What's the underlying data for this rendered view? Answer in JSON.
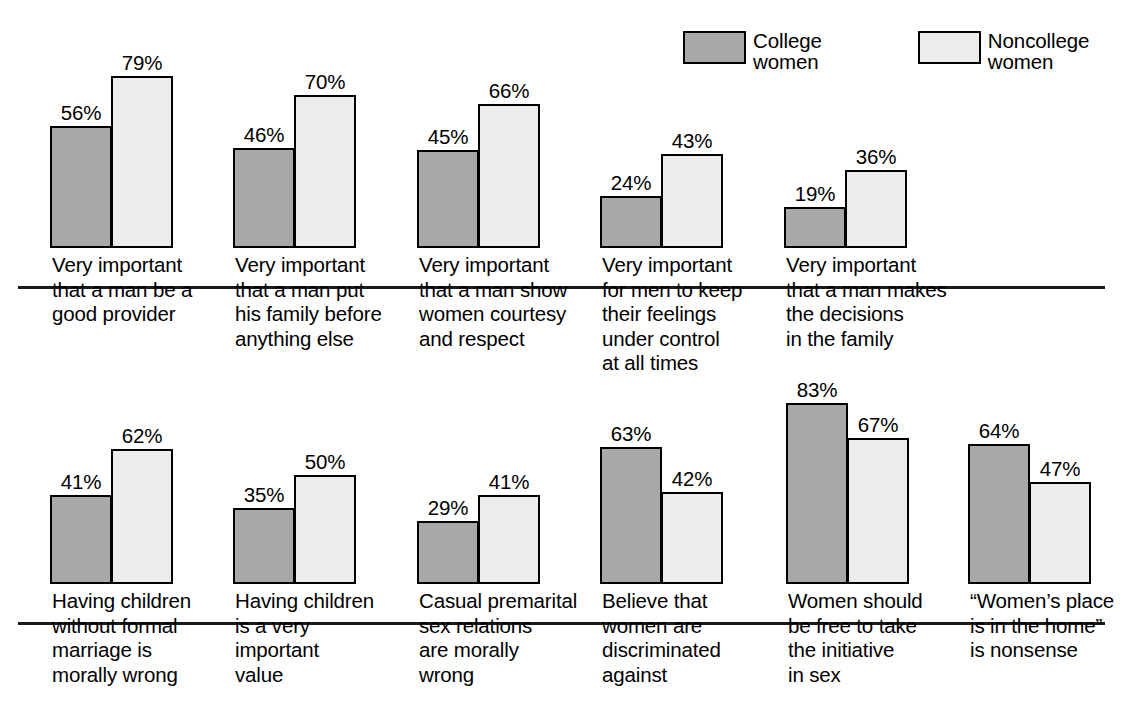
{
  "legend": {
    "entries": [
      {
        "label": "College\nwomen",
        "color": "#a8a8a8",
        "series": "college"
      },
      {
        "label": "Noncollege\nwomen",
        "color": "#ececec",
        "series": "noncollege"
      }
    ]
  },
  "chart_data": {
    "type": "bar",
    "title": "",
    "subtitle": "",
    "xlabel": "",
    "ylabel": "",
    "ylim": [
      0,
      100
    ],
    "grid": false,
    "legend_position": "top-right",
    "value_suffix": "%",
    "series": [
      {
        "name": "College women",
        "color": "#a8a8a8",
        "values": [
          56,
          46,
          45,
          24,
          19,
          41,
          35,
          29,
          63,
          83,
          64
        ]
      },
      {
        "name": "Noncollege women",
        "color": "#ececec",
        "values": [
          79,
          70,
          66,
          43,
          36,
          62,
          50,
          41,
          42,
          67,
          47
        ]
      }
    ],
    "categories": [
      "Very important\nthat a man be a\ngood provider",
      "Very important\nthat a man put\nhis family before\nanything else",
      "Very important\nthat a man show\nwomen courtesy\nand respect",
      "Very important\nfor men to keep\ntheir feelings\nunder control\nat all times",
      "Very important\nthat a man makes\nthe decisions\nin the family",
      "Having children\nwithout formal\nmarriage is\nmorally wrong",
      "Having children\nis a very\nimportant\nvalue",
      "Casual premarital\nsex relations\nare morally\nwrong",
      "Believe that\nwomen are\ndiscriminated\nagainst",
      "Women should\nbe free to take\nthe initiative\nin sex",
      "“Women’s place\nis in the home”\nis nonsense"
    ],
    "panels": [
      {
        "name": "row-1",
        "groups": [
          {
            "category": "Very important\nthat a man be a\ngood provider",
            "college": 56,
            "noncollege": 79,
            "college_label": "56%",
            "noncollege_label": "79%"
          },
          {
            "category": "Very important\nthat a man put\nhis family before\nanything else",
            "college": 46,
            "noncollege": 70,
            "college_label": "46%",
            "noncollege_label": "70%"
          },
          {
            "category": "Very important\nthat a man show\nwomen courtesy\nand respect",
            "college": 45,
            "noncollege": 66,
            "college_label": "45%",
            "noncollege_label": "66%"
          },
          {
            "category": "Very important\nfor men to keep\ntheir feelings\nunder control\nat all times",
            "college": 24,
            "noncollege": 43,
            "college_label": "24%",
            "noncollege_label": "43%"
          },
          {
            "category": "Very important\nthat a man makes\nthe decisions\nin the family",
            "college": 19,
            "noncollege": 36,
            "college_label": "19%",
            "noncollege_label": "36%"
          }
        ]
      },
      {
        "name": "row-2",
        "groups": [
          {
            "category": "Having children\nwithout formal\nmarriage is\nmorally wrong",
            "college": 41,
            "noncollege": 62,
            "college_label": "41%",
            "noncollege_label": "62%"
          },
          {
            "category": "Having children\nis a very\nimportant\nvalue",
            "college": 35,
            "noncollege": 50,
            "college_label": "35%",
            "noncollege_label": "50%"
          },
          {
            "category": "Casual premarital\nsex relations\nare morally\nwrong",
            "college": 29,
            "noncollege": 41,
            "college_label": "29%",
            "noncollege_label": "41%"
          },
          {
            "category": "Believe that\nwomen are\ndiscriminated\nagainst",
            "college": 63,
            "noncollege": 42,
            "college_label": "63%",
            "noncollege_label": "42%"
          },
          {
            "category": "Women should\nbe free to take\nthe initiative\nin sex",
            "college": 83,
            "noncollege": 67,
            "college_label": "83%",
            "noncollege_label": "67%"
          },
          {
            "category": "“Women’s place\nis in the home”\nis nonsense",
            "college": 64,
            "noncollege": 47,
            "college_label": "64%",
            "noncollege_label": "47%"
          }
        ]
      }
    ]
  },
  "layout": {
    "px_per_percent": 2.18,
    "group_pitch": 183,
    "group_start_x": 50,
    "bar_width": 62,
    "label_offsets_row1": [
      50,
      233,
      417,
      600,
      784
    ],
    "label_offsets_row2": [
      50,
      233,
      417,
      600,
      786,
      968
    ]
  }
}
